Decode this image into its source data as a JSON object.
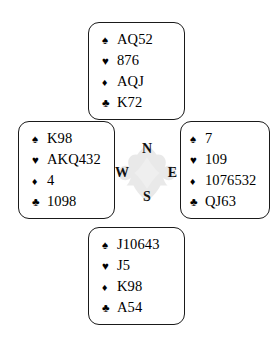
{
  "diagram": {
    "type": "bridge-deal-diagram",
    "suit_symbols": {
      "spade": "♠",
      "heart": "♥",
      "diamond": "♦",
      "club": "♣"
    },
    "suit_color": "#000000",
    "border_color": "#1a1a1a",
    "background_color": "#ffffff"
  },
  "compass": {
    "north_label": "N",
    "south_label": "S",
    "west_label": "W",
    "east_label": "E",
    "watermark": "four-suit-rosette"
  },
  "hands": {
    "north": {
      "position_label": "North",
      "spades": "AQ52",
      "hearts": "876",
      "diamonds": "AQJ",
      "clubs": "K72"
    },
    "west": {
      "position_label": "West",
      "spades": "K98",
      "hearts": "AKQ432",
      "diamonds": "4",
      "clubs": "1098"
    },
    "east": {
      "position_label": "East",
      "spades": "7",
      "hearts": "109",
      "diamonds": "1076532",
      "clubs": "QJ63"
    },
    "south": {
      "position_label": "South",
      "spades": "J10643",
      "hearts": "J5",
      "diamonds": "K98",
      "clubs": "A54"
    }
  }
}
